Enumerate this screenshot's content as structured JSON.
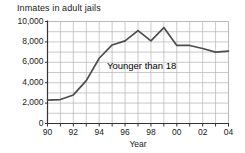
{
  "chart_data": {
    "type": "line",
    "title": "Inmates in adult jails",
    "subtitle": "",
    "xlabel": "Year",
    "ylabel": "",
    "grid": true,
    "legend_position": "inline-annotation",
    "xlim": [
      1990,
      2004
    ],
    "ylim": [
      0,
      10000
    ],
    "ytick_values": [
      0,
      2000,
      4000,
      6000,
      8000,
      10000
    ],
    "ytick_labels": [
      "0",
      "2,000",
      "4,000",
      "6,000",
      "8,000",
      "10,000"
    ],
    "xtick_values": [
      1990,
      1992,
      1994,
      1996,
      1998,
      2000,
      2002,
      2004
    ],
    "xtick_labels": [
      "90",
      "92",
      "94",
      "96",
      "98",
      "00",
      "02",
      "04"
    ],
    "minor_xticks_every": 1,
    "gridline_y_step": 1000,
    "gridline_x_step": 1,
    "annotations": [
      {
        "text": "Younger than 18",
        "x": 1994.6,
        "y": 5600
      }
    ],
    "series": [
      {
        "name": "Younger than 18",
        "color": "#4d4d4d",
        "x": [
          1990,
          1991,
          1992,
          1993,
          1994,
          1995,
          1996,
          1997,
          1998,
          1999,
          2000,
          2001,
          2002,
          2003,
          2004
        ],
        "values": [
          2300,
          2350,
          2800,
          4200,
          6400,
          7700,
          8100,
          9100,
          8100,
          9400,
          7650,
          7650,
          7350,
          7000,
          7100
        ]
      }
    ]
  },
  "colors": {
    "line": "#4d4d4d",
    "grid": "#b3b3b3",
    "axis": "#333333",
    "text": "#1a1a1a",
    "background": "#ffffff"
  }
}
